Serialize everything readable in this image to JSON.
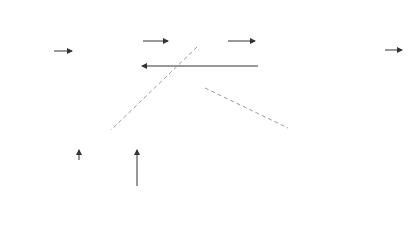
{
  "input": {
    "label_line1": "Packet",
    "label_line2": "sequence"
  },
  "transmitter": {
    "label": "Transmitter",
    "station": "Station A"
  },
  "receiver": {
    "label": "Receiver",
    "station": "Station B"
  },
  "channel": {
    "info_frames_label": "Information frames",
    "control_frames_label_line1": "Control",
    "control_frames_label_line2": "frames"
  },
  "output": {
    "label_line1": "Error-free",
    "label_line2": "packet",
    "label_line3": "sequence"
  },
  "info_frame_detail": {
    "crc": "CRC",
    "header": "Header",
    "packet_line1": "Information",
    "packet_line2": "packet",
    "caption": "Information frame"
  },
  "control_frame_detail": {
    "crc": "CRC",
    "header": "Header",
    "caption": "Control frame"
  },
  "colors": {
    "packet": "#7a7a7a",
    "field": "#dcdcdc",
    "station": "#e4e4e4"
  }
}
